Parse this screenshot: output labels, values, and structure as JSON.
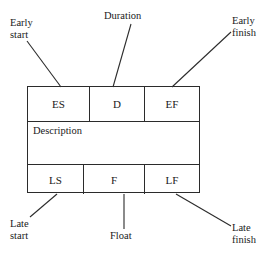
{
  "diagram": {
    "node": {
      "top_row": [
        {
          "key": "es",
          "label": "ES",
          "meaning": "Early start"
        },
        {
          "key": "d",
          "label": "D",
          "meaning": "Duration"
        },
        {
          "key": "ef",
          "label": "EF",
          "meaning": "Early finish"
        }
      ],
      "middle_row": {
        "key": "description",
        "label": "Description"
      },
      "bottom_row": [
        {
          "key": "ls",
          "label": "LS",
          "meaning": "Late start"
        },
        {
          "key": "f",
          "label": "F",
          "meaning": "Float"
        },
        {
          "key": "lf",
          "label": "LF",
          "meaning": "Late finish"
        }
      ]
    },
    "callouts": [
      {
        "key": "early_start",
        "text": "Early\nstart"
      },
      {
        "key": "duration",
        "text": "Duration"
      },
      {
        "key": "early_finish",
        "text": "Early\nfinish"
      },
      {
        "key": "late_start",
        "text": "Late\nstart"
      },
      {
        "key": "float",
        "text": "Float"
      },
      {
        "key": "late_finish",
        "text": "Late\nfinish"
      }
    ],
    "colors": {
      "line": "#2b2b2b",
      "text": "#1a1a1a",
      "background": "#ffffff"
    }
  }
}
